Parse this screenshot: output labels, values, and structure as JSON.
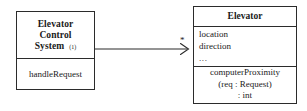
{
  "diagram": {
    "type": "uml-class-diagram",
    "background_color": "#ffffff",
    "line_color": "#2b2b2b",
    "text_color": "#1a1a1a"
  },
  "classes": [
    {
      "id": "elevator-control-system",
      "name_lines": [
        "Elevator",
        "Control",
        "System"
      ],
      "instance_tag": "(1)",
      "attributes": [],
      "operations": [
        "handleRequest"
      ]
    },
    {
      "id": "elevator",
      "name_lines": [
        "Elevator"
      ],
      "instance_tag": "",
      "attributes": [
        "location",
        "direction",
        "..."
      ],
      "operations": [
        "computerProximity",
        "(req : Request)",
        ": int"
      ]
    }
  ],
  "association": {
    "name": "elevator-control-system-to-elevator",
    "source": "elevator-control-system",
    "target": "elevator",
    "arrow_style": "open",
    "target_multiplicity": "*"
  }
}
